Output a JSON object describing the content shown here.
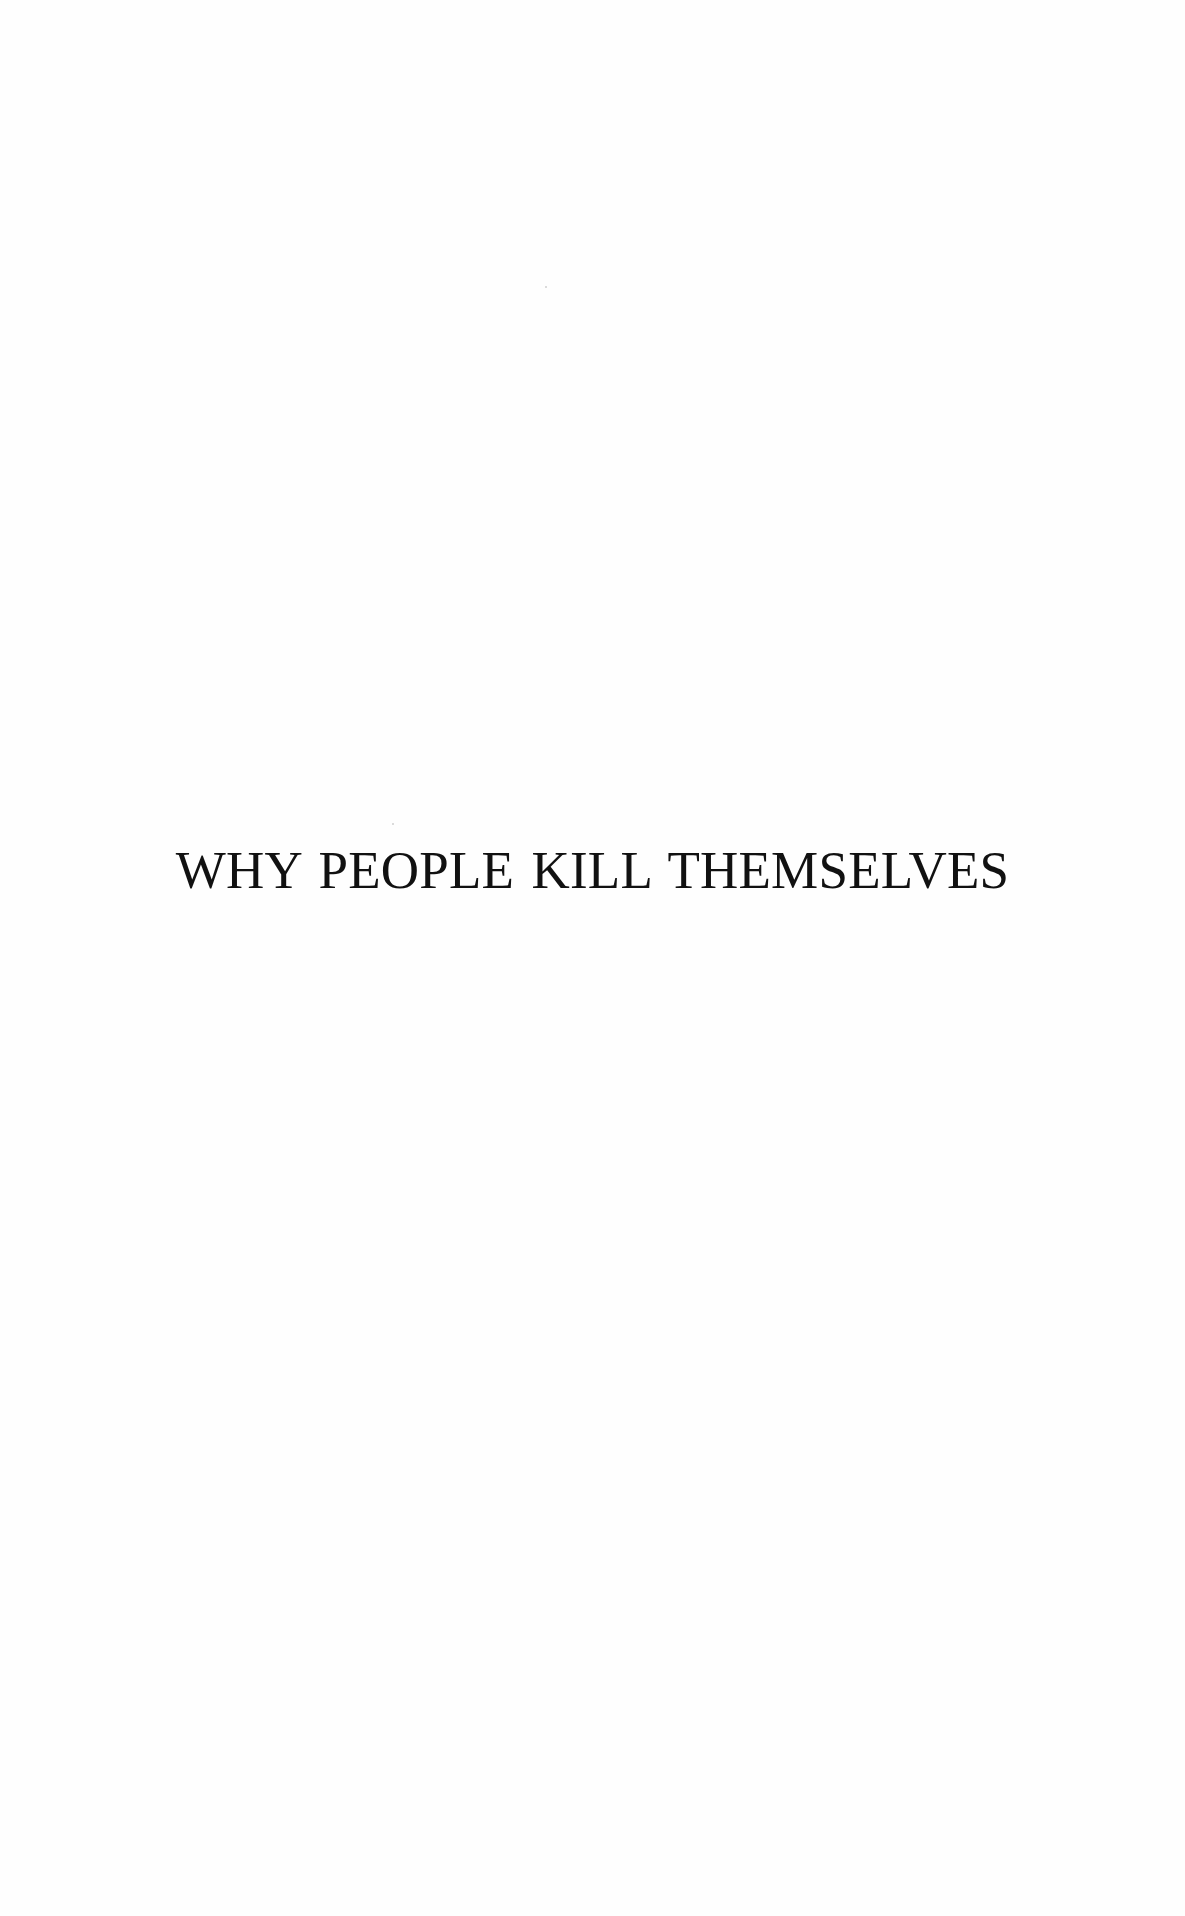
{
  "page": {
    "type": "book half-title page",
    "background_color": "#ffffff",
    "text_color": "#111111"
  },
  "title": {
    "text": "WHY PEOPLE KILL THEMSELVES"
  }
}
